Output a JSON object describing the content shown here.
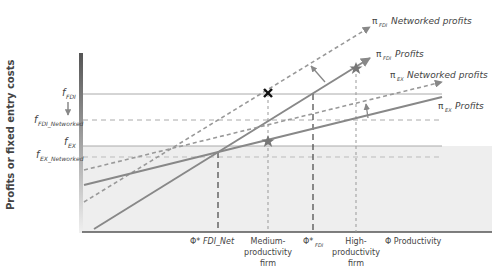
{
  "diagram": {
    "y_axis_label": "Profits or fixed entry costs",
    "x_axis_label": "Φ Productivity",
    "y_labels": {
      "f_fdi": {
        "main": "f",
        "sub": "FDI"
      },
      "f_fdi_networked": {
        "main": "f",
        "sub": "FDI_Networked"
      },
      "f_ex": {
        "main": "f",
        "sub": "EX"
      },
      "f_ex_networked": {
        "main": "f",
        "sub": "EX_Networked"
      }
    },
    "x_labels": {
      "phi_fdi_net": {
        "prefix": "Φ*",
        "text": "FDI_Net"
      },
      "medium": [
        "Medium-",
        "productivity",
        "firm"
      ],
      "phi_fdi": {
        "prefix": "Φ*",
        "sub": "FDI"
      },
      "high": [
        "High-",
        "productivity",
        "firm"
      ]
    },
    "line_labels": {
      "fdi_networked": {
        "pi": "π",
        "sub": "FDI",
        "text": "Networked profits"
      },
      "fdi": {
        "pi": "π",
        "sub": "FDI",
        "text": "Profits"
      },
      "ex_networked": {
        "pi": "π",
        "sub": "EX",
        "text": "Networked profits"
      },
      "ex": {
        "pi": "π",
        "sub": "EX",
        "text": "Profits"
      }
    },
    "markers": {
      "cross": "x-marker",
      "star_medium": "star-marker",
      "star_high": "star-marker"
    },
    "colors": {
      "line": "#888888",
      "dashed": "#888888",
      "shade": "#eeeeee",
      "axis": "#555555",
      "text": "#444444",
      "bar_top": "#555555",
      "bar_bottom": "#f0f0f0"
    }
  }
}
